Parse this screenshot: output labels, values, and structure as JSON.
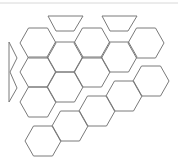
{
  "diagram": {
    "title": "",
    "colors": {
      "stroke": "#7a7a7a",
      "top_rule": "#d8d8d8",
      "background": "#ffffff"
    },
    "hexagon": {
      "half_width": 18,
      "half_top": 9.5,
      "half_height": 15
    },
    "top_rule_y": 3,
    "trapezoids": [
      {
        "points": [
          [
            48,
            16
          ],
          [
            83,
            16
          ],
          [
            74,
            31
          ],
          [
            56,
            31
          ]
        ]
      },
      {
        "points": [
          [
            102,
            16
          ],
          [
            137,
            16
          ],
          [
            128,
            31
          ],
          [
            110,
            31
          ]
        ]
      }
    ],
    "left_zigzag": {
      "points": [
        [
          9,
          42
        ],
        [
          17,
          58
        ],
        [
          10,
          72
        ],
        [
          17,
          88
        ],
        [
          9,
          102
        ],
        [
          9,
          42
        ]
      ]
    },
    "upper_group_centers": [
      [
        38,
        43
      ],
      [
        92,
        43
      ],
      [
        146,
        43
      ],
      [
        65,
        57
      ],
      [
        119,
        57
      ],
      [
        38,
        72
      ],
      [
        92,
        72
      ],
      [
        65,
        87
      ],
      [
        38,
        102
      ]
    ],
    "lower_band_centers": [
      [
        151,
        81
      ],
      [
        124,
        96
      ],
      [
        97,
        111
      ],
      [
        70,
        126
      ],
      [
        43,
        141
      ]
    ]
  }
}
